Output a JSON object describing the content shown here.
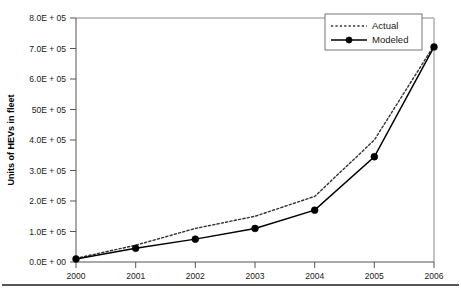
{
  "chart_data": {
    "type": "line",
    "title": "",
    "xlabel": "",
    "ylabel": "Units of HEVs in fleet",
    "x": [
      2000,
      2001,
      2002,
      2003,
      2004,
      2005,
      2006
    ],
    "categories": [
      "2000",
      "2001",
      "2002",
      "2003",
      "2004",
      "2005",
      "2006"
    ],
    "series": [
      {
        "name": "Actual",
        "style": "dotted",
        "marker": "none",
        "color": "#333333",
        "values": [
          12000,
          55000,
          110000,
          150000,
          215000,
          400000,
          710000
        ]
      },
      {
        "name": "Modeled",
        "style": "solid",
        "marker": "filled-circle",
        "color": "#000000",
        "values": [
          10000,
          45000,
          75000,
          110000,
          170000,
          345000,
          705000
        ]
      }
    ],
    "ylim": [
      0,
      800000
    ],
    "xlim": [
      2000,
      2006
    ],
    "ytick_values": [
      0,
      100000,
      200000,
      300000,
      400000,
      500000,
      600000,
      700000,
      800000
    ],
    "ytick_labels": [
      "0.0E + 00",
      "1.0E + 05",
      "2.0E + 05",
      "3.0E + 05",
      "4.0E + 05",
      "50E + 05",
      "6.0E + 05",
      "7.0E + 05",
      "8.0E + 05"
    ],
    "xtick_labels": [
      "2000",
      "2001",
      "2002",
      "2003",
      "2004",
      "2005",
      "2006"
    ],
    "grid": false,
    "legend_position": "top-right",
    "legend_entries": [
      "Actual",
      "Modeled"
    ]
  },
  "figure": {
    "y_axis_title": "Units of HEVs in fleet",
    "legend": {
      "actual_label": "Actual",
      "modeled_label": "Modeled"
    }
  }
}
